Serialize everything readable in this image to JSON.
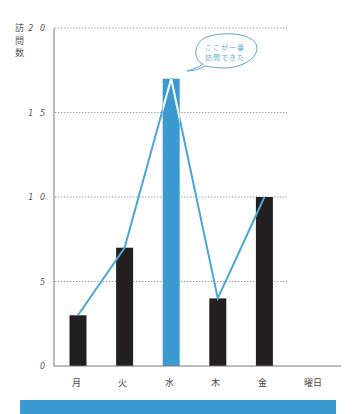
{
  "chart_data": {
    "type": "bar",
    "title": "",
    "xlabel": "曜日",
    "ylabel": "訪問数",
    "ylabel_chars": [
      "訪",
      "問",
      "数"
    ],
    "categories": [
      "月",
      "火",
      "水",
      "木",
      "金"
    ],
    "values": [
      3,
      7,
      17,
      4,
      10
    ],
    "overlay_line": {
      "type": "line",
      "values": [
        3,
        7,
        17,
        4,
        10
      ]
    },
    "highlight_index": 2,
    "ylim": [
      0,
      20
    ],
    "yticks": [
      0,
      5,
      10,
      15,
      20
    ],
    "ytick_labels": [
      "0",
      "5",
      "1 0",
      "1 5",
      "2 0"
    ],
    "grid": {
      "horizontal": true,
      "style": "dotted"
    },
    "legend": null,
    "annotation": {
      "target_category": "水",
      "lines": [
        "ここが一番",
        "訪問できた"
      ],
      "shape": "speech-bubble"
    }
  },
  "colors": {
    "bar": "#231f20",
    "highlight_bar": "#3b9ad0",
    "line": "#4aa6d4",
    "axis": "#777777",
    "grid": "#8a8a8a",
    "bubble_stroke": "#5ea6cc",
    "bottom_band": "#3b9ad0"
  }
}
